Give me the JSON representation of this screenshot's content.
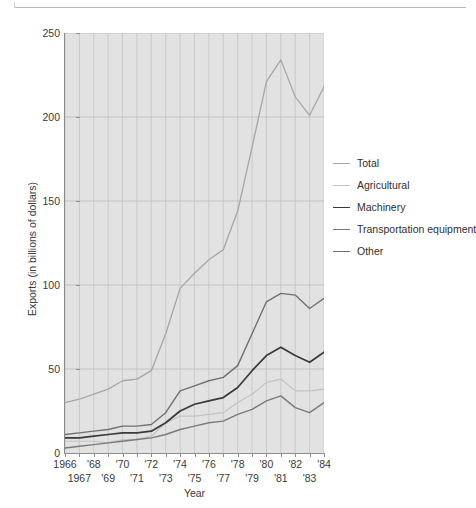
{
  "chart_data": {
    "type": "line",
    "title": "",
    "xlabel": "Year",
    "ylabel": "Exports (in billions of dollars)",
    "xlim": [
      1966,
      1984
    ],
    "ylim": [
      0,
      250
    ],
    "ytick_values": [
      0,
      50,
      100,
      150,
      200,
      250
    ],
    "ytick_labels": [
      "0",
      "50",
      "100",
      "150",
      "200",
      "250"
    ],
    "xtick_row1_values": [
      1966,
      1968,
      1970,
      1972,
      1974,
      1976,
      1978,
      1980,
      1982,
      1984
    ],
    "xtick_row1_labels": [
      "1966",
      "'68",
      "'70",
      "'72",
      "'74",
      "'76",
      "'78",
      "'80",
      "'82",
      "'84"
    ],
    "xtick_row2_values": [
      1967,
      1969,
      1971,
      1973,
      1975,
      1977,
      1979,
      1981,
      1983
    ],
    "xtick_row2_labels": [
      "1967",
      "'69",
      "'71",
      "'73",
      "'75",
      "'77",
      "'79",
      "'81",
      "'83"
    ],
    "x": [
      1966,
      1967,
      1968,
      1969,
      1970,
      1971,
      1972,
      1973,
      1974,
      1975,
      1976,
      1977,
      1978,
      1979,
      1980,
      1981,
      1982,
      1983,
      1984
    ],
    "grid": true,
    "grid_x": true,
    "grid_y": true,
    "legend_position": "right",
    "plot_background": "#e2e2e2",
    "series": [
      {
        "name": "Total",
        "color": "#a6a6a6",
        "width": 1.3,
        "values": [
          30,
          32,
          35,
          38,
          43,
          44,
          49,
          71,
          98,
          107,
          115,
          121,
          144,
          182,
          221,
          234,
          212,
          201,
          218
        ]
      },
      {
        "name": "Agricultural",
        "color": "#c3c3c3",
        "width": 1.2,
        "values": [
          7,
          7,
          7,
          6,
          8,
          8,
          10,
          18,
          22,
          22,
          23,
          24,
          30,
          35,
          42,
          44,
          37,
          37,
          38
        ]
      },
      {
        "name": "Machinery",
        "color": "#3a3a3a",
        "width": 1.7,
        "values": [
          9,
          9,
          10,
          11,
          12,
          12,
          13,
          18,
          25,
          29,
          31,
          33,
          39,
          49,
          58,
          63,
          58,
          54,
          60
        ]
      },
      {
        "name": "Transportation equipment",
        "color": "#7a7a7a",
        "width": 1.4,
        "values": [
          3,
          4,
          5,
          6,
          7,
          8,
          9,
          11,
          14,
          16,
          18,
          19,
          23,
          26,
          31,
          34,
          27,
          24,
          30
        ]
      },
      {
        "name": "Other",
        "color": "#707070",
        "width": 1.4,
        "values": [
          11,
          12,
          13,
          14,
          16,
          16,
          17,
          24,
          37,
          40,
          43,
          45,
          52,
          71,
          90,
          95,
          94,
          86,
          92
        ]
      }
    ]
  },
  "legend": {
    "items": [
      {
        "label": "Total"
      },
      {
        "label": "Agricultural"
      },
      {
        "label": "Machinery"
      },
      {
        "label": "Transportation equipment"
      },
      {
        "label": "Other"
      }
    ]
  }
}
